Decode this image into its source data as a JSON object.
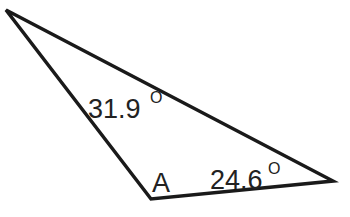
{
  "diagram": {
    "type": "triangle",
    "stroke_color": "#1a1a1a",
    "vertices": {
      "top_left": {
        "x": 6,
        "y": 10
      },
      "bottom": {
        "x": 151,
        "y": 199
      },
      "right": {
        "x": 333,
        "y": 181
      }
    },
    "labels": {
      "angle_top_left": {
        "value": "31.9",
        "unit": "O"
      },
      "vertex_bottom": {
        "text": "A"
      },
      "angle_right": {
        "value": "24.6",
        "unit": "O"
      }
    }
  }
}
